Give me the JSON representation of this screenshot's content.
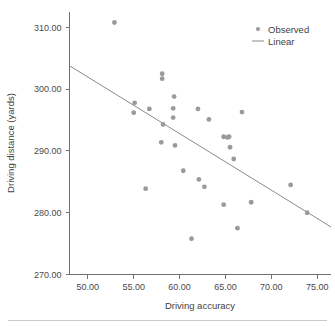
{
  "chart_data": {
    "type": "scatter",
    "title": "",
    "xlabel": "Driving accuracy",
    "ylabel": "Driving distance (yards)",
    "xlim": [
      48.0,
      76.5
    ],
    "ylim": [
      270.0,
      312.5
    ],
    "grid": false,
    "legend_position": "top-right",
    "xticks": [
      50.0,
      55.0,
      60.0,
      65.0,
      70.0,
      75.0
    ],
    "xtick_labels": [
      "50.00",
      "55.00",
      "60.00",
      "65.00",
      "70.00",
      "75.00"
    ],
    "yticks": [
      270.0,
      280.0,
      290.0,
      300.0,
      310.0
    ],
    "ytick_labels": [
      "270.00",
      "280.00",
      "290.00",
      "300.00",
      "310.00"
    ],
    "series": [
      {
        "name": "Observed",
        "type": "scatter",
        "marker": "circle",
        "color": "#9a9a9a",
        "points": [
          {
            "x": 52.9,
            "y": 310.8
          },
          {
            "x": 58.1,
            "y": 302.5
          },
          {
            "x": 58.1,
            "y": 301.7
          },
          {
            "x": 59.4,
            "y": 298.8
          },
          {
            "x": 55.1,
            "y": 297.8
          },
          {
            "x": 59.3,
            "y": 296.9
          },
          {
            "x": 56.7,
            "y": 296.8
          },
          {
            "x": 62.0,
            "y": 296.8
          },
          {
            "x": 66.8,
            "y": 296.3
          },
          {
            "x": 55.0,
            "y": 296.2
          },
          {
            "x": 59.3,
            "y": 295.4
          },
          {
            "x": 63.2,
            "y": 295.1
          },
          {
            "x": 58.2,
            "y": 294.3
          },
          {
            "x": 64.8,
            "y": 292.3
          },
          {
            "x": 65.4,
            "y": 292.3
          },
          {
            "x": 65.2,
            "y": 292.2
          },
          {
            "x": 58.0,
            "y": 291.4
          },
          {
            "x": 59.5,
            "y": 290.9
          },
          {
            "x": 65.5,
            "y": 290.6
          },
          {
            "x": 65.9,
            "y": 288.7
          },
          {
            "x": 60.4,
            "y": 286.8
          },
          {
            "x": 62.1,
            "y": 285.4
          },
          {
            "x": 72.1,
            "y": 284.5
          },
          {
            "x": 62.7,
            "y": 284.2
          },
          {
            "x": 56.3,
            "y": 283.9
          },
          {
            "x": 67.8,
            "y": 281.7
          },
          {
            "x": 64.8,
            "y": 281.3
          },
          {
            "x": 73.9,
            "y": 280.0
          },
          {
            "x": 66.3,
            "y": 277.5
          },
          {
            "x": 61.3,
            "y": 275.8
          }
        ]
      },
      {
        "name": "Linear",
        "type": "line",
        "color": "#8a8a8a",
        "endpoints": [
          {
            "x": 48.0,
            "y": 303.8
          },
          {
            "x": 76.5,
            "y": 277.7
          }
        ]
      }
    ],
    "legend": [
      {
        "label": "Observed",
        "marker": "dot",
        "color": "#9a9a9a"
      },
      {
        "label": "Linear",
        "marker": "line",
        "color": "#8a8a8a"
      }
    ]
  }
}
